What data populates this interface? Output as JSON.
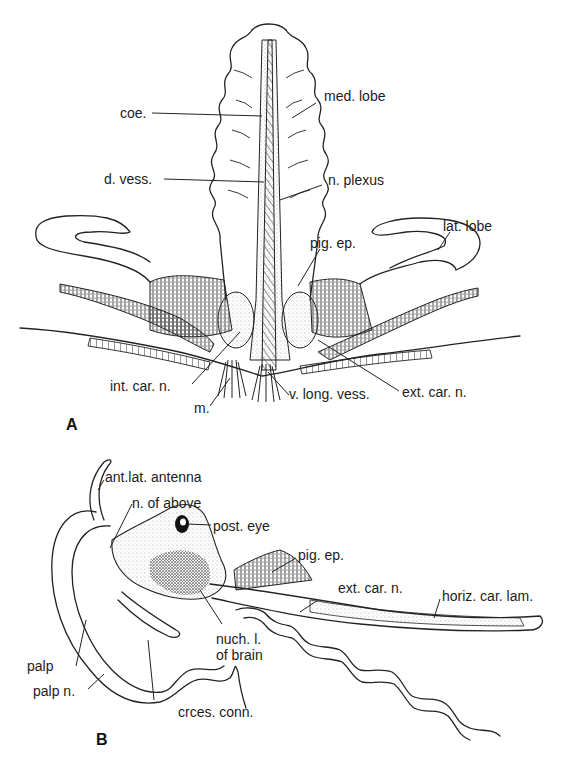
{
  "figure": {
    "panels": [
      {
        "id": "A",
        "label": "A",
        "annotations": {
          "coe": "coe.",
          "med_lobe": "med. lobe",
          "d_vess": "d. vess.",
          "n_plexus": "n. plexus",
          "lat_lobe": "lat. lobe",
          "pig_ep": "pig. ep.",
          "int_car_n": "int. car. n.",
          "ext_car_n": "ext. car. n.",
          "m": "m.",
          "v_long_vess": "v. long. vess."
        }
      },
      {
        "id": "B",
        "label": "B",
        "annotations": {
          "ant_lat_antenna": "ant.lat. antenna",
          "n_of_above": "n. of above",
          "post_eye": "post. eye",
          "pig_ep": "pig. ep.",
          "ext_car_n": "ext. car. n.",
          "horiz_car_lam": "horiz. car. lam.",
          "nuch_l_line1": "nuch. l.",
          "nuch_l_line2": "of brain",
          "palp": "palp",
          "palp_n": "palp n.",
          "crces_conn": "crces. conn."
        }
      }
    ],
    "colors": {
      "ink": "#222222",
      "background": "#ffffff"
    }
  }
}
